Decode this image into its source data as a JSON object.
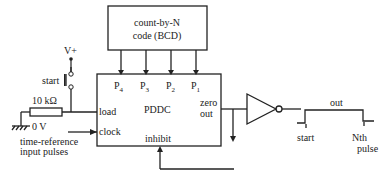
{
  "diagram": {
    "code_box": {
      "line1": "count-by-N",
      "line2": "code (BCD)"
    },
    "pddc": {
      "title": "PDDC",
      "inputs": {
        "p4": "P",
        "p4_sub": "4",
        "p3": "P",
        "p3_sub": "3",
        "p2": "P",
        "p2_sub": "2",
        "p1": "P",
        "p1_sub": "1"
      },
      "load": "load",
      "clock": "clock",
      "inhibit": "inhibit",
      "zero_out_1": "zero",
      "zero_out_2": "out"
    },
    "supply": "V+",
    "switch_label": "start",
    "resistor_label": "10 kΩ",
    "ground_label": "0 V",
    "clock_note_1": "time-reference",
    "clock_note_2": "input pulses",
    "output": {
      "label": "out",
      "start": "start",
      "end_1": "Nth",
      "end_2": "pulse"
    }
  }
}
